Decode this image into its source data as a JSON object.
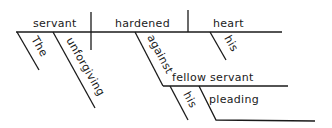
{
  "diagram": {
    "type": "sentence-diagram",
    "subject": "servant",
    "verb": "hardened",
    "direct_object": "heart",
    "subject_modifiers": [
      "The",
      "unforgiving"
    ],
    "object_modifiers": [
      "his"
    ],
    "preposition": "against",
    "prepositional_object": "fellow servant",
    "prepositional_object_modifiers": [
      "his",
      "pleading"
    ]
  },
  "words": {
    "subject": "servant",
    "verb": "hardened",
    "object": "heart",
    "the": "The",
    "unforgiving": "unforgiving",
    "his_heart": "his",
    "against": "against",
    "fellow_servant": "fellow servant",
    "his_servant": "his",
    "pleading": "pleading"
  },
  "colors": {
    "ink": "#1a1a1a",
    "background": "#ffffff"
  }
}
